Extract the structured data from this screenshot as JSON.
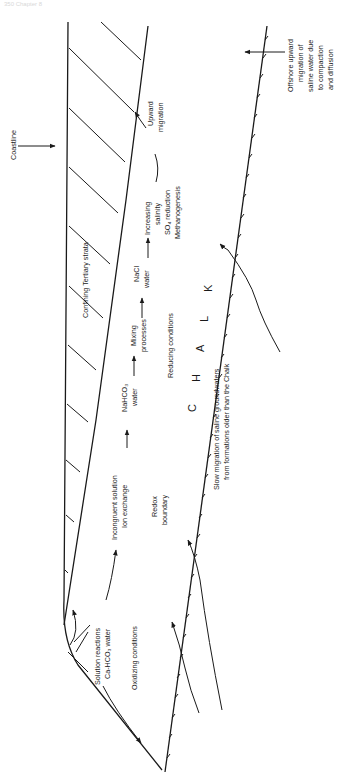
{
  "page_header": "350 Chapter 8",
  "diagram": {
    "orientation": "rotated 90deg clockwise (text reads bottom-to-top)",
    "labels": {
      "coastline": "Coastline",
      "offshore_1": "Offshore upward",
      "offshore_2": "migration of",
      "offshore_3": "saline water due",
      "offshore_4": "to compaction",
      "offshore_5": "and diffusion",
      "confining": "Confining Tertiary strata",
      "upward_1": "Upward",
      "upward_2": "migration",
      "increasing_1": "Increasing",
      "increasing_2": "salinity",
      "increasing_3": "SO₄ reduction",
      "increasing_4": "Methanogenesis",
      "nacl_1": "NaCl",
      "nacl_2": "water",
      "mixing_1": "Mixing",
      "mixing_2": "processes",
      "reducing": "Reducing conditions",
      "nahco3_1": "NaHCO₃",
      "nahco3_2": "water",
      "incongruent_1": "Incongruent solution",
      "incongruent_2": "Ion exchange",
      "redox_1": "Redox",
      "redox_2": "boundary",
      "solution_1": "Solution reactions",
      "solution_2": "Ca-HCO₃ water",
      "oxidizing": "Oxidizing conditions",
      "chalk_c": "C",
      "chalk_h": "H",
      "chalk_a": "A",
      "chalk_l": "L",
      "chalk_k": "K",
      "slow_1": "Slow migration of saline groundwaters",
      "slow_2": "from formations older than the Chalk"
    }
  }
}
